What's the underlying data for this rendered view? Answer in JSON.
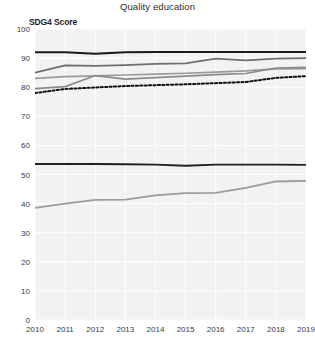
{
  "chart_data": {
    "type": "line",
    "title": "Quality education",
    "xlabel": "",
    "ylabel": "SDG4 Score",
    "ylim": [
      0,
      100
    ],
    "grid": true,
    "legend": "none",
    "x": [
      2010,
      2011,
      2012,
      2013,
      2014,
      2015,
      2016,
      2017,
      2018,
      2019
    ],
    "categories": [
      "2010",
      "2011",
      "2012",
      "2013",
      "2014",
      "2015",
      "2016",
      "2017",
      "2018",
      "2019"
    ],
    "yticks": [
      0,
      10,
      20,
      30,
      40,
      50,
      60,
      70,
      80,
      90,
      100
    ],
    "series": [
      {
        "name": "series-1-top-flat",
        "color": "#1a1a1a",
        "style": "solid",
        "width": 1.9,
        "values": [
          92.0,
          92.0,
          91.5,
          92.0,
          92.1,
          92.1,
          92.1,
          92.1,
          92.1,
          92.1
        ]
      },
      {
        "name": "series-2-upper-rising",
        "color": "#6e6e6e",
        "style": "solid",
        "width": 1.7,
        "values": [
          85.0,
          87.5,
          87.3,
          87.6,
          88.0,
          88.2,
          89.8,
          89.2,
          89.8,
          90.0
        ]
      },
      {
        "name": "series-3-mid",
        "color": "#9a9a9a",
        "style": "solid",
        "width": 1.7,
        "values": [
          83.0,
          83.6,
          83.9,
          84.2,
          84.5,
          84.8,
          85.2,
          85.6,
          86.3,
          86.4
        ]
      },
      {
        "name": "series-4-spike",
        "color": "#8a8a8a",
        "style": "solid",
        "width": 1.7,
        "values": [
          79.5,
          80.2,
          84.0,
          82.8,
          83.3,
          83.8,
          84.3,
          84.7,
          86.6,
          86.8
        ]
      },
      {
        "name": "series-5-dotted",
        "color": "#111111",
        "style": "dotted",
        "width": 2.0,
        "values": [
          78.0,
          79.4,
          79.9,
          80.4,
          80.7,
          81.0,
          81.4,
          81.8,
          83.2,
          83.8
        ]
      },
      {
        "name": "series-6-lower-flat",
        "color": "#1f1f1f",
        "style": "solid",
        "width": 1.9,
        "values": [
          53.6,
          53.6,
          53.6,
          53.5,
          53.4,
          53.0,
          53.4,
          53.4,
          53.4,
          53.3
        ]
      },
      {
        "name": "series-7-lower-rising",
        "color": "#9b9b9b",
        "style": "solid",
        "width": 1.8,
        "values": [
          38.5,
          40.0,
          41.3,
          41.4,
          42.8,
          43.6,
          43.7,
          45.4,
          47.6,
          47.8
        ]
      }
    ]
  }
}
